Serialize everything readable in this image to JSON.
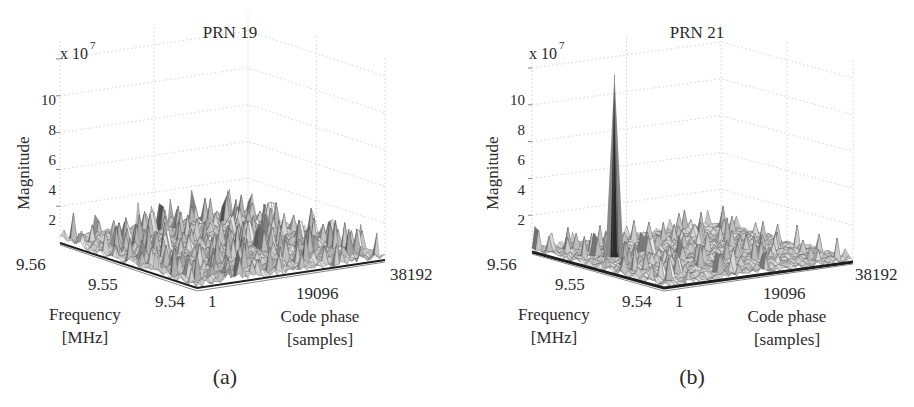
{
  "figure": {
    "panels": [
      {
        "id": "a",
        "title": "PRN 19",
        "caption": "(a)",
        "z_exponent_base": "x 10",
        "z_exponent_power": "7",
        "z_label": "Magnitude",
        "z_ticks": [
          "2",
          "4",
          "6",
          "8",
          "10"
        ],
        "freq_label_line1": "Frequency",
        "freq_label_line2": "[MHz]",
        "freq_ticks": [
          "9.56",
          "9.55",
          "9.54"
        ],
        "code_label_line1": "Code phase",
        "code_label_line2": "[samples]",
        "code_ticks": [
          "1",
          "19096",
          "38192"
        ]
      },
      {
        "id": "b",
        "title": "PRN 21",
        "caption": "(b)",
        "z_exponent_base": "x 10",
        "z_exponent_power": "7",
        "z_label": "Magnitude",
        "z_ticks": [
          "2",
          "4",
          "6",
          "8",
          "10"
        ],
        "freq_label_line1": "Frequency",
        "freq_label_line2": "[MHz]",
        "freq_ticks": [
          "9.56",
          "9.55",
          "9.54"
        ],
        "code_label_line1": "Code phase",
        "code_label_line2": "[samples]",
        "code_ticks": [
          "1",
          "19096",
          "38192"
        ]
      }
    ],
    "colors": {
      "surface_dark": "#1e1e1e",
      "surface_light": "#e6e6e6",
      "grid": "#c8c8c8",
      "text": "#2b2b2b"
    }
  },
  "chart_data": [
    {
      "type": "surface3d",
      "title": "PRN 19",
      "caption": "(a)",
      "xlabel": "Code phase [samples]",
      "ylabel": "Frequency [MHz]",
      "zlabel": "Magnitude",
      "z_scale": "x 10^7",
      "x_ticks": [
        1,
        19096,
        38192
      ],
      "y_ticks": [
        9.54,
        9.55,
        9.56
      ],
      "z_ticks": [
        2,
        4,
        6,
        8,
        10
      ],
      "xlim": [
        1,
        38192
      ],
      "ylim": [
        9.54,
        9.56
      ],
      "zlim": [
        0,
        11
      ],
      "grid": true,
      "description": "Noise floor only, no distinct correlation peak",
      "noise_floor_mean": 0.6,
      "noise_peak_max": 1.6,
      "peak": null
    },
    {
      "type": "surface3d",
      "title": "PRN 21",
      "caption": "(b)",
      "xlabel": "Code phase [samples]",
      "ylabel": "Frequency [MHz]",
      "zlabel": "Magnitude",
      "z_scale": "x 10^7",
      "x_ticks": [
        1,
        19096,
        38192
      ],
      "y_ticks": [
        9.54,
        9.55,
        9.56
      ],
      "z_ticks": [
        2,
        4,
        6,
        8,
        10
      ],
      "xlim": [
        1,
        38192
      ],
      "ylim": [
        9.54,
        9.56
      ],
      "zlim": [
        0,
        11
      ],
      "grid": true,
      "description": "Single sharp acquisition peak above noise floor",
      "noise_floor_mean": 0.5,
      "noise_peak_max": 1.8,
      "peak": {
        "code_phase_approx": 6000,
        "frequency_approx_mhz": 9.552,
        "magnitude": 10.2
      }
    }
  ]
}
